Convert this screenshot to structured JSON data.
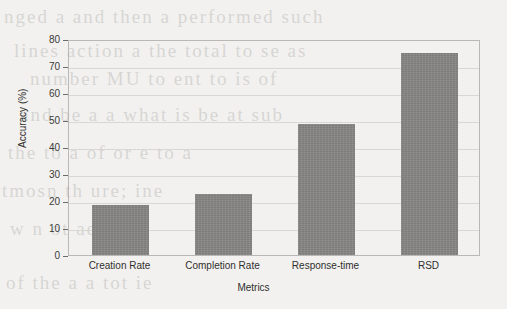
{
  "chart_data": {
    "type": "bar",
    "title": "",
    "xlabel": "Metrics",
    "ylabel": "Accuracy (%)",
    "categories": [
      "Creation Rate",
      "Completion Rate",
      "Response-time",
      "RSD"
    ],
    "values": [
      18.5,
      22.5,
      48.5,
      75
    ],
    "ylim": [
      0,
      80
    ],
    "ytick_labels": [
      "0",
      "10",
      "20",
      "30",
      "40",
      "50",
      "60",
      "70",
      "80"
    ],
    "ytick_values": [
      0,
      10,
      20,
      30,
      40,
      50,
      60,
      70,
      80
    ],
    "grid": true,
    "legend": false,
    "bar_color": "#868583",
    "background_color": "#f2f1ef",
    "axis_color": "#b9b8b5"
  },
  "scan_artifacts": {
    "ghost_lines": [
      "nged a and then a performed such",
      "lines action a the total to se as",
      "number MU to ent to is of",
      "and be a a what is be at sub",
      "the to a of or e to a",
      "tmosn th ure; ine",
      "w n ot ae es",
      "of the a a tot ie"
    ]
  }
}
